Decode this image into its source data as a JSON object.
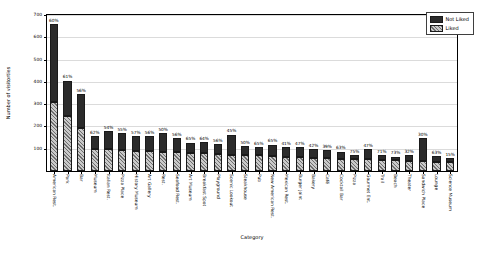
{
  "chart_data": {
    "type": "bar",
    "stacked": true,
    "title": "",
    "xlabel": "Category",
    "ylabel": "Number of visitorties",
    "ylim": [
      0,
      700
    ],
    "yticks": [
      100,
      200,
      300,
      400,
      500,
      600,
      700
    ],
    "grid": true,
    "legend_position": "upper right",
    "categories": [
      "American Rest.",
      "Park",
      "Bar",
      "Museum",
      "Italian Rest.",
      "Pizza Place",
      "History Museum",
      "Art Gallery",
      "Rest.",
      "Seafood Rest.",
      "Art Museum",
      "Breakfast Spot",
      "Playground",
      "Scenic Lookout",
      "Steakhouse",
      "Pub",
      "New American Rest.",
      "Mexican Rest.",
      "Burger Joint",
      "Bakery",
      "Café",
      "Cocktail Bar",
      "Pizza",
      "Gourmet Ent.",
      "Trail",
      "Beach",
      "Theater",
      "Sandwich Place",
      "Lounge",
      "Science Museum"
    ],
    "series": [
      {
        "name": "Liked",
        "values": [
          310,
          245,
          195,
          98,
          97,
          94,
          90,
          88,
          85,
          84,
          83,
          82,
          78,
          74,
          72,
          70,
          69,
          63,
          62,
          60,
          58,
          55,
          53,
          52,
          50,
          48,
          46,
          44,
          42,
          40
        ]
      },
      {
        "name": "Not Liked",
        "values": [
          350,
          160,
          150,
          60,
          82,
          76,
          68,
          69,
          85,
          65,
          45,
          46,
          42,
          89,
          39,
          38,
          49,
          43,
          45,
          39,
          37,
          32,
          17,
          47,
          20,
          16,
          25,
          103,
          25,
          18
        ]
      }
    ],
    "bar_labels": [
      "60%",
      "61%",
      "56%",
      "62%",
      "54%",
      "55%",
      "57%",
      "56%",
      "50%",
      "56%",
      "65%",
      "64%",
      "56%",
      "45%",
      "50%",
      "65%",
      "65%",
      "41%",
      "47%",
      "42%",
      "39%",
      "63%",
      "75%",
      "47%",
      "71%",
      "73%",
      "32%",
      "30%",
      "63%",
      "15%"
    ],
    "legend": [
      {
        "label": "Not Liked",
        "color": "#2b2b2b",
        "pattern": "solid"
      },
      {
        "label": "Liked",
        "color": "#c9c9c9",
        "pattern": "hatched"
      }
    ]
  }
}
